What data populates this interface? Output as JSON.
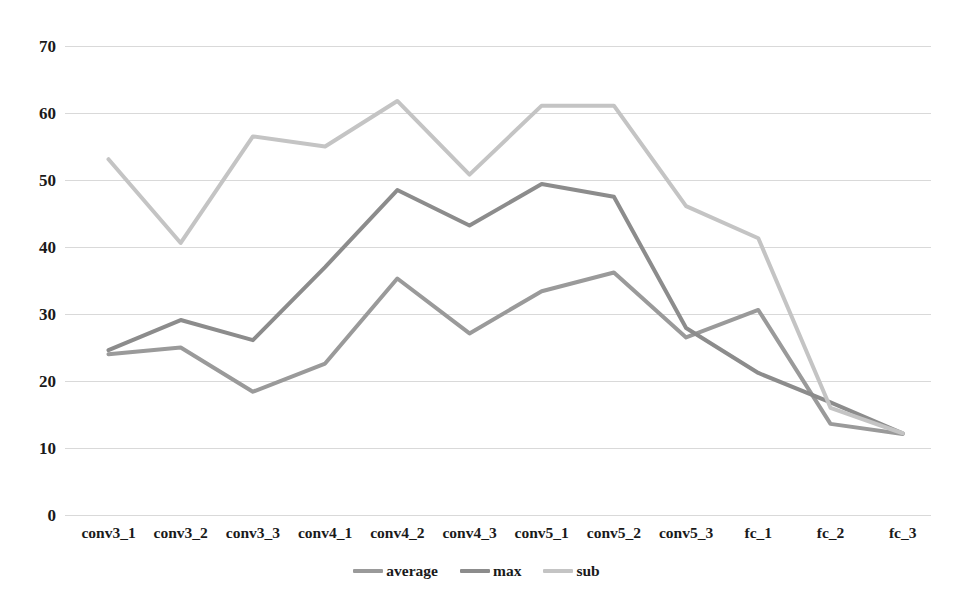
{
  "chart_data": {
    "type": "line",
    "title": "",
    "subtitle": "",
    "xlabel": "",
    "ylabel": "",
    "categories": [
      "conv3_1",
      "conv3_2",
      "conv3_3",
      "conv4_1",
      "conv4_2",
      "conv4_3",
      "conv5_1",
      "conv5_2",
      "conv5_3",
      "fc_1",
      "fc_2",
      "fc_3"
    ],
    "series": [
      {
        "name": "average",
        "color": "#9a9a9a",
        "values": [
          24.0,
          25.0,
          18.4,
          22.6,
          35.3,
          27.1,
          33.4,
          36.2,
          26.5,
          30.6,
          13.6,
          12.1
        ]
      },
      {
        "name": "max",
        "color": "#8c8c8c",
        "values": [
          24.6,
          29.1,
          26.1,
          37.0,
          48.5,
          43.2,
          49.4,
          47.5,
          27.9,
          21.2,
          16.8,
          12.2
        ]
      },
      {
        "name": "sub",
        "color": "#c4c4c4",
        "values": [
          53.1,
          40.6,
          56.5,
          55.0,
          61.8,
          50.8,
          61.1,
          61.1,
          46.1,
          41.3,
          16.0,
          12.2
        ]
      }
    ],
    "ylim": [
      0,
      70
    ],
    "ytick_values": [
      0,
      10,
      20,
      30,
      40,
      50,
      60,
      70
    ],
    "ytick_labels": [
      "0",
      "10",
      "20",
      "30",
      "40",
      "50",
      "60",
      "70"
    ],
    "grid": true,
    "grid_color": "#d9d9d9",
    "legend_position": "bottom",
    "legend_entries": [
      "average",
      "max",
      "sub"
    ]
  }
}
